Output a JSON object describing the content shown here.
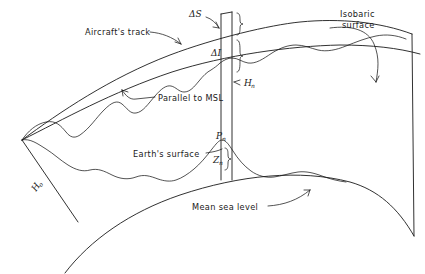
{
  "figure": {
    "background_color": "#ffffff",
    "ink_color": "#1a1a1a",
    "width": 425,
    "height": 274
  },
  "labels": {
    "aircraft_track": "Aircraft's track",
    "isobaric_surface_line1": "Isobaric",
    "isobaric_surface_line2": "surface",
    "parallel_to_msl": "Parallel to MSL",
    "earths_surface": "Earth's surface",
    "mean_sea_level": "Mean sea level"
  },
  "symbols": {
    "delta_s": "ΔS",
    "delta_i": "ΔI",
    "h_n_base": "H",
    "h_n_sub": "n",
    "p_n_base": "P",
    "p_n_sub": "n",
    "z_n_base": "Z",
    "z_n_sub": "n",
    "h_o_base": "H",
    "h_o_sub": "o"
  },
  "curves": {
    "isobaric_surface": "M 22,140 C 60,112 110,78 170,55 C 215,38 270,25 300,22 C 340,18 380,22 412,34",
    "parallel_to_msl": "M 22,140 C 62,120 112,92 172,72 C 225,55 290,46 340,45 C 372,45 398,48 420,54",
    "mean_sea_level": "M 65,273 C 90,240 130,212 180,195 C 240,175 300,169 350,182 C 378,190 398,208 414,236",
    "aircraft_track": "M 22,140 C 28,131 36,124 46,122 C 56,120 61,126 66,132 C 70,137 74,139 80,135 C 90,128 96,118 104,110 C 112,102 117,100 122,104 C 127,108 130,114 136,113 C 143,112 148,104 155,96 C 161,89 166,85 171,86 C 176,87 179,92 184,92 C 190,92 194,87 199,81 C 203,76 207,72 211,70 C 214,68 217,66 220,63 C 224,60 228,58 232,58 C 238,58 242,62 248,63 C 256,64 263,59 272,53 C 280,48 288,45 296,45 C 304,45 310,48 318,50 C 327,52 336,50 346,46 C 356,42 366,38 376,36 C 386,34 396,35 406,39",
    "earth_surface": "M 22,140 C 30,138 38,144 46,149 C 54,154 60,160 68,165 C 76,170 83,172 90,170 C 98,168 104,171 112,175 C 120,179 128,180 136,177 C 144,174 150,176 158,179 C 164,181 170,182 176,180 C 182,178 188,174 194,169 C 200,164 206,157 212,149 C 216,144 219,140 222,140 C 226,140 229,145 233,151 C 238,159 244,166 251,171 C 258,176 266,178 274,177 C 282,176 290,173 298,172 C 306,171 314,173 322,176 C 330,179 338,181 346,182",
    "radial_ho": "M 22,140 L 78,222",
    "radial_right": "M 412,34 L 414,236",
    "column_left": "M 221,14 L 221,180",
    "column_right": "M 232,12 L 232,180",
    "column_cap": "M 221,14 L 232,12"
  },
  "leaders": {
    "aircraft_track_leader": "M 150,32 C 162,33 172,37 181,44",
    "aircraft_track_arrow": "M 181,44 L 175,42 M 181,44 L 178,38",
    "delta_s_leader": "M 206,17 C 212,19 216,23 219,28",
    "delta_s_arrow": "M 219,28 L 213,27 M 219,28 L 216,22",
    "isobaric_bracket": "M 330,28 C 352,25 368,30 374,44 C 380,58 378,70 376,82",
    "isobaric_arrow": "M 376,82 L 371,76 M 376,82 L 379,76",
    "parallel_leader": "M 155,97 L 136,99 C 130,100 126,96 122,90",
    "parallel_arrow": "M 122,90 L 123,96 M 122,90 L 128,92",
    "hn_arrow": "M 240,80 L 234,82 M 234,82 L 240,85",
    "mean_sea_leader": "M 268,206 C 284,205 298,200 310,190",
    "mean_sea_arrow": "M 310,190 L 304,190 M 310,190 L 308,196",
    "earth_surface_leader": "M 206,153 C 213,152 218,151 222,149"
  },
  "braces": {
    "delta_s_brace": "M 237,13 C 240,13 240,17 240,20 C 240,23 241,24 243,24 C 241,24 240,25 240,28 C 240,31 240,35 237,35",
    "delta_i_brace": "M 237,40 C 240,40 240,46 240,51 C 240,55 241,56 243,56 C 241,56 240,57 240,61 C 240,66 240,72 237,72",
    "z_n_brace": "M 225,148 C 228,148 228,152 228,155 C 228,158 229,159 231,159 C 229,159 228,160 228,163 C 228,166 228,170 225,170"
  },
  "symbol_positions": {
    "delta_s": {
      "x": 189,
      "y": 17
    },
    "delta_i": {
      "x": 211,
      "y": 56
    },
    "h_n": {
      "x": 244,
      "y": 86
    },
    "p_n": {
      "x": 216,
      "y": 139
    },
    "z_n": {
      "x": 213,
      "y": 163
    },
    "h_o": {
      "x": 36,
      "y": 192
    }
  },
  "label_positions": {
    "aircraft_track": {
      "x": 85,
      "y": 35
    },
    "isobaric_line1": {
      "x": 340,
      "y": 17
    },
    "isobaric_line2": {
      "x": 342,
      "y": 28
    },
    "parallel_to_msl": {
      "x": 158,
      "y": 101
    },
    "earths_surface": {
      "x": 133,
      "y": 157
    },
    "mean_sea_level": {
      "x": 192,
      "y": 210
    }
  }
}
